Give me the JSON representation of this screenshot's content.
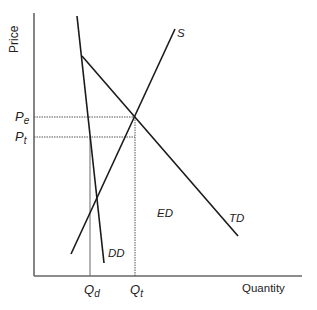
{
  "diagram": {
    "axes": {
      "y_label": "Price",
      "x_label": "Quantity"
    },
    "price_labels": {
      "pe": {
        "main": "P",
        "sub": "e"
      },
      "pt": {
        "main": "P",
        "sub": "t"
      }
    },
    "quantity_labels": {
      "qd": {
        "main": "Q",
        "sub": "d"
      },
      "qt": {
        "main": "Q",
        "sub": "t"
      }
    },
    "curves": {
      "supply": "S",
      "total_demand": "TD",
      "domestic_demand": "DD",
      "export_demand": "ED"
    },
    "colors": {
      "curve": "#1a1a1a",
      "axis": "#666666",
      "guide": "#555555"
    }
  }
}
